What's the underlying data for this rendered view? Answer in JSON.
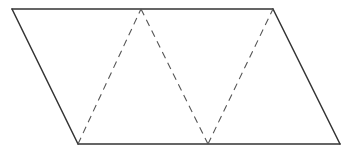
{
  "diagram": {
    "type": "parallelogram-triangulation",
    "colors": {
      "solid_stroke": "#333333",
      "dashed_stroke": "#555555",
      "background": "#ffffff"
    },
    "vertices": {
      "top_left": [
        12,
        9
      ],
      "top_mid": [
        141,
        9
      ],
      "top_right": [
        273,
        9
      ],
      "bottom_left": [
        78,
        144
      ],
      "bottom_mid": [
        208,
        144
      ],
      "bottom_right": [
        340,
        144
      ]
    },
    "solid_edges": [
      {
        "name": "top-edge",
        "from": "top_left",
        "to": "top_right"
      },
      {
        "name": "right-edge",
        "from": "top_right",
        "to": "bottom_right"
      },
      {
        "name": "bottom-edge",
        "from": "bottom_right",
        "to": "bottom_left"
      },
      {
        "name": "left-edge",
        "from": "bottom_left",
        "to": "top_left"
      }
    ],
    "dashed_edges": [
      {
        "name": "dashed-edge-1",
        "from": "bottom_left",
        "to": "top_mid"
      },
      {
        "name": "dashed-edge-2",
        "from": "top_mid",
        "to": "bottom_mid"
      },
      {
        "name": "dashed-edge-3",
        "from": "bottom_mid",
        "to": "top_right"
      }
    ]
  }
}
